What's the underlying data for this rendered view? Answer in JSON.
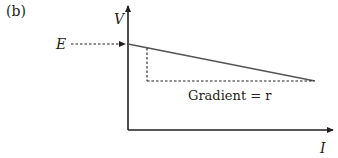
{
  "figure": {
    "panel_label": "(b)",
    "y_axis_label": "V",
    "x_axis_label": "I",
    "intercept_label": "E",
    "gradient_label": "Gradient = r"
  },
  "colors": {
    "axis": "#231f20",
    "line": "#555555",
    "dotted": "#231f20"
  }
}
